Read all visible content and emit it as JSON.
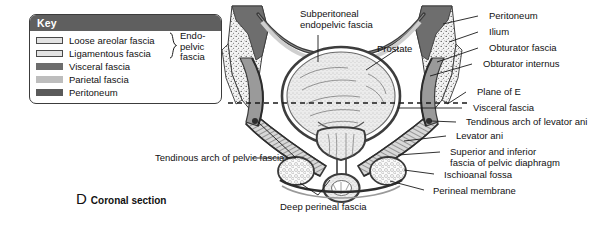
{
  "figure": {
    "caption_letter": "D",
    "caption_text": "Coronal section"
  },
  "key": {
    "title": "Key",
    "items": [
      {
        "label": "Loose areolar fascia",
        "swatch": "outlined-swatch"
      },
      {
        "label": "Ligamentous fascia",
        "swatch": "outlined-swatch"
      },
      {
        "label": "Visceral fascia",
        "swatch": "solid-dark-swatch"
      },
      {
        "label": "Parietal fascia",
        "swatch": "solid-light-swatch"
      },
      {
        "label": "Peritoneum",
        "swatch": "solid-black-swatch"
      }
    ],
    "group_label_line1": "Endo-",
    "group_label_line2": "pelvic",
    "group_label_line3": "fascia"
  },
  "labels": {
    "subperitoneal_line1": "Subperitoneal",
    "subperitoneal_line2": "endopelvic fascia",
    "prostate": "Prostate",
    "peritoneum": "Peritoneum",
    "ilium": "Ilium",
    "obturator_fascia": "Obturator fascia",
    "obturator_internus": "Obturator internus",
    "plane_of_e": "Plane of E",
    "visceral_fascia": "Visceral fascia",
    "tendinous_arch_levator_ani": "Tendinous arch of levator ani",
    "levator_ani": "Levator ani",
    "superior_inferior_line1": "Superior and inferior",
    "superior_inferior_line2": "fascia of pelvic diaphragm",
    "ischioanal_fossa": "Ischioanal fossa",
    "perineal_membrane": "Perineal membrane",
    "tendinous_arch_pelvic_fascia": "Tendinous arch of pelvic fascia",
    "deep_perineal_fascia": "Deep perineal fascia"
  },
  "colors": {
    "key_header_bg": "#5f5f5f",
    "key_border": "#3c3c3c",
    "text": "#111111",
    "leader_line": "#1a1a1a",
    "bone_fill": "#f2f2f2",
    "muscle_dark": "#4a4a4a",
    "muscle_mid": "#8a8a8a",
    "muscle_light": "#c9c9c9",
    "organ_fill": "#ededed",
    "page_bg": "#ffffff"
  }
}
